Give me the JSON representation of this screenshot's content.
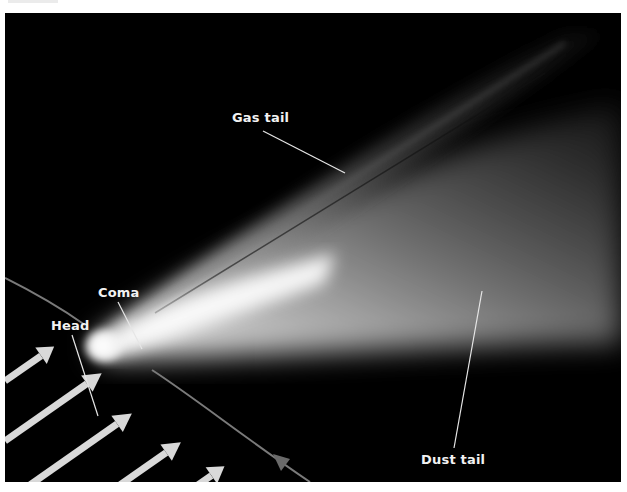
{
  "diagram": {
    "labels": {
      "gas_tail": "Gas tail",
      "coma": "Coma",
      "head": "Head",
      "dust_tail": "Dust tail"
    },
    "elements": {
      "solar_wind_arrows": 6,
      "orbit_path": "curved line passing through comet head",
      "direction_arrow": "small arrow on orbit path at bottom right"
    },
    "colors": {
      "background": "#000000",
      "comet_core": "#ffffff",
      "tail_glow": "#bdbdbd",
      "arrows": "#d9d9d9",
      "orbit_line": "#7a7a7a",
      "label_text": "#f2f2f2"
    }
  }
}
